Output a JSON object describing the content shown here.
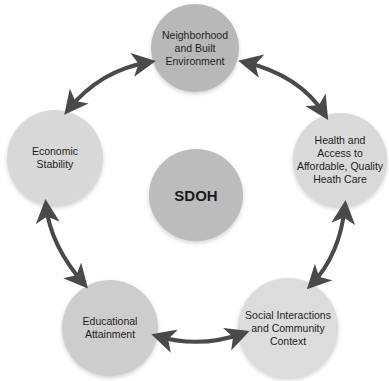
{
  "diagram": {
    "title": "SDOH",
    "center": {
      "label": "SDOH",
      "color": "#bcbcbc"
    },
    "nodes": [
      {
        "id": "top",
        "label": "Neighborhood\nand Built\nEnvironment",
        "color": "#b8b8b8"
      },
      {
        "id": "right",
        "label": "Health and\nAccess to\nAffordable, Quality\nHeath Care",
        "color": "#d9d9d9"
      },
      {
        "id": "bottom_right",
        "label": "Social Interactions\nand Community\nContext",
        "color": "#dcdcdc"
      },
      {
        "id": "bottom_left",
        "label": "Educational\nAttainment",
        "color": "#cdcdcd"
      },
      {
        "id": "left",
        "label": "Economic\nStability",
        "color": "#d8d8d8"
      }
    ],
    "connections": [
      {
        "from": "top",
        "to": "right",
        "type": "bidirectional"
      },
      {
        "from": "right",
        "to": "bottom_right",
        "type": "bidirectional"
      },
      {
        "from": "bottom_right",
        "to": "bottom_left",
        "type": "bidirectional"
      },
      {
        "from": "bottom_left",
        "to": "left",
        "type": "bidirectional"
      },
      {
        "from": "left",
        "to": "top",
        "type": "bidirectional"
      }
    ],
    "arrow_color": "#4a4a4a"
  }
}
